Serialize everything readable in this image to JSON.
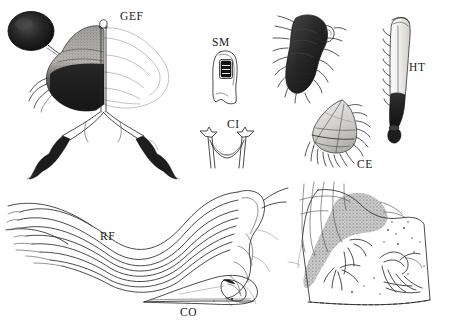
{
  "plate": {
    "background_color": "#ffffff",
    "ink_color": "#2b2b2b",
    "label_color": "#1b1b1b"
  },
  "labels": [
    {
      "id": "GEF",
      "text": "GEF",
      "x": 120,
      "y": 11,
      "meaning": "genital-fork-figure-label"
    },
    {
      "id": "SM",
      "text": "SM",
      "x": 212,
      "y": 37,
      "meaning": "spiracular-membrane-figure-label"
    },
    {
      "id": "CI",
      "text": "CI",
      "x": 227,
      "y": 119,
      "meaning": "cibarium-figure-label"
    },
    {
      "id": "HT",
      "text": "HT",
      "x": 409,
      "y": 62,
      "meaning": "hind-tibia-figure-label"
    },
    {
      "id": "CE",
      "text": "CE",
      "x": 357,
      "y": 159,
      "meaning": "cercus-figure-label"
    },
    {
      "id": "RF",
      "text": "RF",
      "x": 100,
      "y": 231,
      "meaning": "rachis-fibres-figure-label"
    },
    {
      "id": "CO",
      "text": "CO",
      "x": 180,
      "y": 307,
      "meaning": "costal-figure-label"
    }
  ],
  "panels": [
    {
      "id": "gef",
      "label": "GEF",
      "kind": "head-and-legs-with-knob",
      "labelled": true
    },
    {
      "id": "sm",
      "label": "SM",
      "kind": "plate-with-aperture",
      "labelled": true
    },
    {
      "id": "ci",
      "label": "CI",
      "kind": "u-shaped-fork",
      "labelled": true
    },
    {
      "id": "palp",
      "label": "",
      "kind": "dark-spined-palp",
      "labelled": false
    },
    {
      "id": "ce",
      "label": "CE",
      "kind": "fringed-lobe",
      "labelled": true
    },
    {
      "id": "ht",
      "label": "HT",
      "kind": "elongate-tibia",
      "labelled": true
    },
    {
      "id": "rf",
      "label": "RF",
      "kind": "fibre-bundle",
      "labelled": true
    },
    {
      "id": "co",
      "label": "CO",
      "kind": "costal-lobe",
      "labelled": true
    },
    {
      "id": "habitat",
      "label": "",
      "kind": "stippled-habitat-box",
      "labelled": false
    }
  ]
}
